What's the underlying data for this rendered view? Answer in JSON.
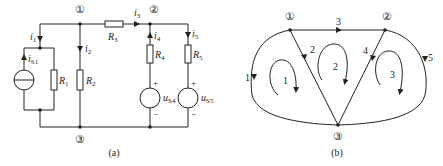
{
  "figure_a": {
    "caption": "(a)",
    "nodes": {
      "n1": "①",
      "n2": "②",
      "n3": "③"
    },
    "currents": {
      "i1": "i",
      "i1_sub": "1",
      "i2": "i",
      "i2_sub": "2",
      "i3": "i",
      "i3_sub": "3",
      "i4": "i",
      "i4_sub": "4",
      "i5": "i",
      "i5_sub": "5",
      "iS1": "i",
      "iS1_sub": "S1"
    },
    "resistors": {
      "R1": "R",
      "R1_sub": "1",
      "R2": "R",
      "R2_sub": "2",
      "R3": "R",
      "R3_sub": "3",
      "R4": "R",
      "R4_sub": "4",
      "R5": "R",
      "R5_sub": "5"
    },
    "sources": {
      "uS4": "u",
      "uS4_sub": "S4",
      "uS5": "u",
      "uS5_sub": "S5",
      "plus": "+",
      "minus": "−"
    }
  },
  "figure_b": {
    "caption": "(b)",
    "nodes": {
      "n1": "①",
      "n2": "②",
      "n3": "③"
    },
    "branches": [
      "1",
      "2",
      "3",
      "4",
      "5"
    ],
    "loops": [
      "1",
      "2",
      "3"
    ]
  }
}
